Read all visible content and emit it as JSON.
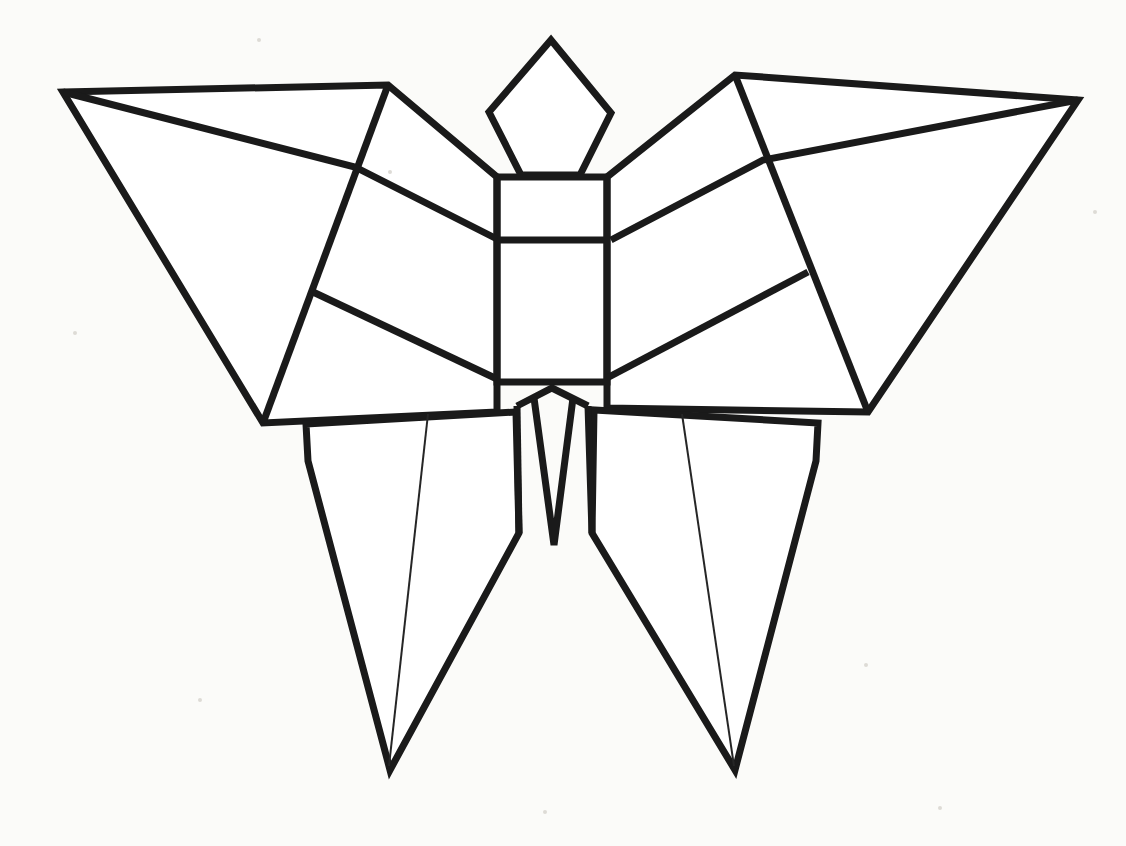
{
  "figure": {
    "style": "black-outline-on-white",
    "background_color": "#fbfbf9",
    "line_color": "#1a1a1a",
    "fill_color": "#ffffff",
    "canvas": {
      "width": 1126,
      "height": 846
    }
  },
  "chart_data": {
    "type": "diagram",
    "xlabel": "",
    "ylabel": "",
    "coordinate_space": {
      "width": 1126,
      "height": 846,
      "origin": "top-left"
    },
    "parts": [
      {
        "name": "head-diamond",
        "description": "Kite / diamond shaped head above the thorax",
        "stroke": "heavy",
        "closed": true,
        "points": [
          [
            551,
            40
          ],
          [
            611,
            113
          ],
          [
            580,
            175
          ],
          [
            521,
            175
          ],
          [
            489,
            112
          ]
        ]
      },
      {
        "name": "body-rectangle",
        "description": "Rectangular thorax and abdomen block",
        "stroke": "heavy",
        "closed": true,
        "points": [
          [
            497,
            177
          ],
          [
            607,
            177
          ],
          [
            607,
            382
          ],
          [
            497,
            382
          ]
        ]
      },
      {
        "name": "body-divider-line",
        "description": "Horizontal crease across the body block",
        "stroke": "heavy",
        "closed": false,
        "points": [
          [
            497,
            240
          ],
          [
            607,
            240
          ]
        ]
      },
      {
        "name": "left-forewing",
        "description": "Large upper-left wing panel",
        "stroke": "heavy",
        "closed": true,
        "points": [
          [
            63,
            92
          ],
          [
            388,
            85
          ],
          [
            497,
            177
          ],
          [
            497,
            412
          ],
          [
            263,
            423
          ]
        ]
      },
      {
        "name": "left-forewing-crease-outer",
        "description": "Fold line from upper wing corner down to lower wing corner",
        "stroke": "heavy",
        "closed": false,
        "points": [
          [
            388,
            85
          ],
          [
            263,
            423
          ]
        ]
      },
      {
        "name": "left-forewing-crease-diagonal",
        "description": "Crease from the wing tip sweeping to the body divider",
        "stroke": "heavy",
        "closed": false,
        "points": [
          [
            63,
            92
          ],
          [
            355,
            167
          ],
          [
            497,
            239
          ]
        ]
      },
      {
        "name": "left-forewing-crease-lower",
        "description": "Short crease from mid fold to the body bottom corner",
        "stroke": "heavy",
        "closed": false,
        "points": [
          [
            313,
            292
          ],
          [
            497,
            379
          ]
        ]
      },
      {
        "name": "right-forewing",
        "description": "Large upper-right wing panel",
        "stroke": "heavy",
        "closed": true,
        "points": [
          [
            1078,
            100
          ],
          [
            735,
            75
          ],
          [
            607,
            177
          ],
          [
            607,
            408
          ],
          [
            868,
            412
          ]
        ]
      },
      {
        "name": "right-forewing-crease-outer",
        "description": "Fold line from upper wing corner down to lower wing corner",
        "stroke": "heavy",
        "closed": false,
        "points": [
          [
            735,
            75
          ],
          [
            868,
            412
          ]
        ]
      },
      {
        "name": "right-forewing-crease-diagonal",
        "description": "Crease from the wing tip sweeping to the body divider",
        "stroke": "heavy",
        "closed": false,
        "points": [
          [
            1078,
            100
          ],
          [
            763,
            160
          ],
          [
            611,
            240
          ]
        ]
      },
      {
        "name": "right-forewing-crease-lower",
        "description": "Short crease from mid fold to the body bottom corner",
        "stroke": "heavy",
        "closed": false,
        "points": [
          [
            808,
            272
          ],
          [
            607,
            378
          ]
        ]
      },
      {
        "name": "left-hindwing",
        "description": "Long pointed lower-left wing / tail",
        "stroke": "heavy",
        "closed": true,
        "points": [
          [
            306,
            424
          ],
          [
            308,
            461
          ],
          [
            390,
            770
          ],
          [
            519,
            533
          ],
          [
            516,
            412
          ]
        ]
      },
      {
        "name": "left-hindwing-vein",
        "description": "Thin interior vein line of the left hindwing",
        "stroke": "thin",
        "closed": false,
        "points": [
          [
            428,
            414
          ],
          [
            389,
            766
          ]
        ]
      },
      {
        "name": "right-hindwing",
        "description": "Long pointed lower-right wing / tail",
        "stroke": "heavy",
        "closed": true,
        "points": [
          [
            818,
            423
          ],
          [
            816,
            461
          ],
          [
            735,
            770
          ],
          [
            592,
            533
          ],
          [
            594,
            410
          ]
        ]
      },
      {
        "name": "right-hindwing-vein",
        "description": "Thin interior vein line of the right hindwing",
        "stroke": "thin",
        "closed": false,
        "points": [
          [
            682,
            414
          ],
          [
            734,
            766
          ]
        ]
      },
      {
        "name": "tail-center-v",
        "description": "Central V shaped abdomen tip between the hindwings",
        "stroke": "heavy",
        "closed": false,
        "points": [
          [
            517,
            406
          ],
          [
            552,
            388
          ],
          [
            588,
            406
          ]
        ]
      },
      {
        "name": "tail-left-edge",
        "description": "Left outer edge of the central tail",
        "stroke": "heavy",
        "closed": false,
        "points": [
          [
            517,
            406
          ],
          [
            519,
            533
          ]
        ]
      },
      {
        "name": "tail-right-edge",
        "description": "Right outer edge of the central tail",
        "stroke": "heavy",
        "closed": false,
        "points": [
          [
            588,
            406
          ],
          [
            592,
            533
          ]
        ]
      },
      {
        "name": "tail-inner-v",
        "description": "Inner V of the central tail tip",
        "stroke": "heavy",
        "closed": false,
        "points": [
          [
            534,
            398
          ],
          [
            554,
            545
          ],
          [
            573,
            398
          ]
        ]
      }
    ],
    "specks": [
      {
        "x": 259,
        "y": 40,
        "r": 2
      },
      {
        "x": 1095,
        "y": 212,
        "r": 2
      },
      {
        "x": 75,
        "y": 333,
        "r": 2
      },
      {
        "x": 390,
        "y": 172,
        "r": 2
      },
      {
        "x": 866,
        "y": 665,
        "r": 2
      },
      {
        "x": 200,
        "y": 700,
        "r": 2
      },
      {
        "x": 545,
        "y": 812,
        "r": 2
      },
      {
        "x": 940,
        "y": 808,
        "r": 2
      }
    ]
  }
}
